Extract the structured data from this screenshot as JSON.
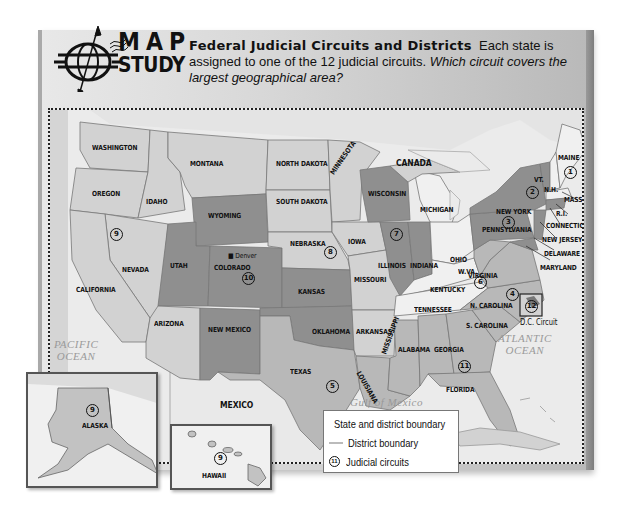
{
  "header": {
    "logo_top": "MAP",
    "logo_bottom": "STUDY",
    "title": "Federal Judicial Circuits and Districts",
    "body": "Each state is assigned to one of the 12 judicial circuits.",
    "question": "Which circuit covers the largest geographical area?"
  },
  "map": {
    "region_labels": {
      "canada": "CANADA",
      "mexico": "MEXICO",
      "pacific": "PACIFIC OCEAN",
      "pacific_l1": "PACIFIC",
      "pacific_l2": "OCEAN",
      "atlantic_l1": "ATLANTIC",
      "atlantic_l2": "OCEAN",
      "gulf": "Gulf of Mexico"
    },
    "states": {
      "washington": "WASHINGTON",
      "oregon": "OREGON",
      "idaho": "IDAHO",
      "montana": "MONTANA",
      "wyoming": "WYOMING",
      "nevada": "NEVADA",
      "california": "CALIFORNIA",
      "utah": "UTAH",
      "colorado": "COLORADO",
      "arizona": "ARIZONA",
      "new_mexico": "NEW MEXICO",
      "north_dakota": "NORTH DAKOTA",
      "south_dakota": "SOUTH DAKOTA",
      "nebraska": "NEBRASKA",
      "kansas": "KANSAS",
      "oklahoma": "OKLAHOMA",
      "texas": "TEXAS",
      "minnesota": "MINNESOTA",
      "iowa": "IOWA",
      "missouri": "MISSOURI",
      "arkansas": "ARKANSAS",
      "louisiana": "LOUISIANA",
      "wisconsin": "WISCONSIN",
      "illinois": "ILLINOIS",
      "indiana": "INDIANA",
      "michigan": "MICHIGAN",
      "ohio": "OHIO",
      "kentucky": "KENTUCKY",
      "tennessee": "TENNESSEE",
      "mississippi": "MISSISSIPPI",
      "alabama": "ALABAMA",
      "georgia": "GEORGIA",
      "florida": "FLORIDA",
      "south_carolina": "S. CAROLINA",
      "north_carolina": "N. CAROLINA",
      "virginia": "VIRGINIA",
      "west_virginia": "W.VA.",
      "pennsylvania": "PENNSYLVANIA",
      "new_york": "NEW YORK",
      "vermont": "VT.",
      "new_hampshire": "N.H.",
      "maine": "MAINE",
      "massachusetts": "MASS.",
      "rhode_island": "R.I.",
      "connecticut": "CONNECTICUT",
      "new_jersey": "NEW JERSEY",
      "delaware": "DELAWARE",
      "maryland": "MARYLAND",
      "alaska": "ALASKA",
      "hawaii": "HAWAII"
    },
    "city": "Denver",
    "dc_circuit_label": "D.C. Circuit",
    "circuits": {
      "c1": "1",
      "c2": "2",
      "c3": "3",
      "c4": "4",
      "c5": "5",
      "c6": "6",
      "c7": "7",
      "c8": "8",
      "c9": "9",
      "c10": "10",
      "c11": "11",
      "c12": "12",
      "c9_alaska": "9",
      "c9_hawaii": "9"
    }
  },
  "legend": {
    "items": [
      {
        "label": "State and district boundary",
        "color": "#777777"
      },
      {
        "label": "District boundary",
        "color": "#bbbbbb"
      },
      {
        "label": "Judicial circuits",
        "symbol": "11"
      }
    ]
  },
  "colors": {
    "light_state": "#d2d2d2",
    "mid_state": "#b8b8b8",
    "dark_state": "#8f8f8f",
    "white_state": "#f0f0f0",
    "water": "#ebebeb"
  }
}
